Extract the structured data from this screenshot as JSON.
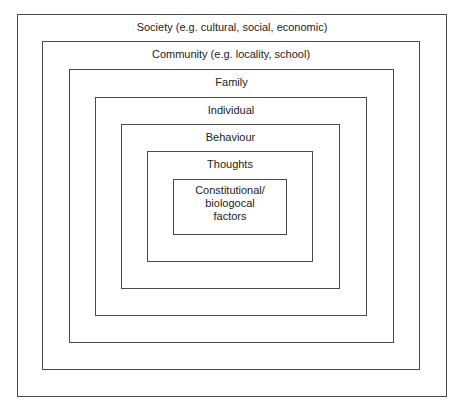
{
  "diagram": {
    "type": "nested-layers",
    "layers": [
      {
        "label": "Society (e.g. cultural, social, economic)"
      },
      {
        "label": "Community (e.g. locality, school)"
      },
      {
        "label": "Family"
      },
      {
        "label": "Individual"
      },
      {
        "label": "Behaviour"
      },
      {
        "label": "Thoughts"
      },
      {
        "label": "Constitutional/\nbiologocal\nfactors",
        "lines": [
          "Constitutional/",
          "biologocal",
          "factors"
        ]
      }
    ]
  }
}
